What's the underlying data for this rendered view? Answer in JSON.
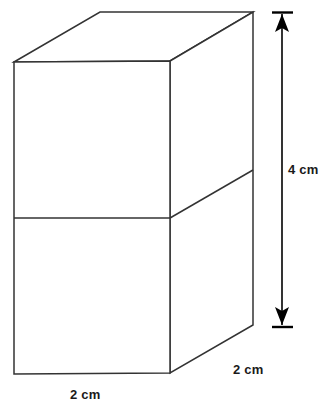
{
  "figure": {
    "shape_name": "rectangular-prism",
    "stroke_color": "#333333",
    "fill_color": "#ffffff",
    "background_color": "#ffffff",
    "stroke_width": 1.5
  },
  "labels": {
    "height": "4 cm",
    "depth": "2 cm",
    "width": "2 cm"
  },
  "geometry": {
    "front_face": {
      "top_left": [
        14,
        62
      ],
      "top_right": [
        170,
        61
      ],
      "bottom_right": [
        170,
        373
      ],
      "bottom_left": [
        14,
        374
      ]
    },
    "top_face": {
      "front_left": [
        14,
        62
      ],
      "back_left": [
        100,
        12
      ],
      "back_right": [
        253,
        12
      ],
      "front_right": [
        170,
        61
      ]
    },
    "right_face": {
      "front_top": [
        170,
        61
      ],
      "back_top": [
        253,
        12
      ],
      "back_bottom": [
        253,
        325
      ],
      "front_bottom": [
        170,
        373
      ]
    },
    "divider_front": [
      [
        14,
        218
      ],
      [
        170,
        218
      ]
    ],
    "divider_right": [
      [
        170,
        218
      ],
      [
        253,
        170
      ]
    ]
  },
  "dimension_arrow": {
    "axis_x": 282,
    "top_tick_y": 12,
    "bottom_tick_y": 327,
    "tick_half_width": 10,
    "arrow_head_length": 16,
    "arrow_head_half_width": 7,
    "color": "#000000"
  }
}
